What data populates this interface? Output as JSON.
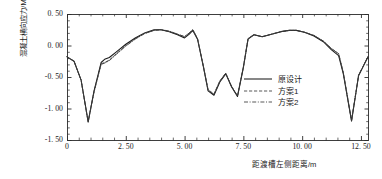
{
  "chart_data": {
    "type": "line",
    "title": "",
    "xlabel": "距渡槽左侧距离/m",
    "ylabel": "混凝土横向应力/MPa",
    "xlim": [
      0,
      12.8
    ],
    "ylim": [
      -1.5,
      0.5
    ],
    "xticks": [
      "0",
      "2. 50",
      "5. 00",
      "7. 50",
      "10. 00",
      "12. 50"
    ],
    "xtick_values": [
      0,
      2.5,
      5.0,
      7.5,
      10.0,
      12.5
    ],
    "yticks": [
      "0. 50",
      "0. 00",
      "-0. 50",
      "-1. 00",
      "-1. 50"
    ],
    "ytick_values": [
      0.5,
      0.0,
      -0.5,
      -1.0,
      -1.5
    ],
    "grid": false,
    "legend_position": "center-right",
    "series": [
      {
        "name": "原设计",
        "style": "solid",
        "color": "#1a1a1a",
        "x": [
          0.0,
          0.3,
          0.6,
          0.9,
          1.15,
          1.45,
          1.6,
          1.8,
          2.1,
          2.5,
          2.9,
          3.3,
          3.7,
          4.0,
          4.35,
          4.7,
          5.0,
          5.2,
          5.35,
          5.55,
          5.8,
          6.0,
          6.25,
          6.5,
          6.75,
          7.0,
          7.25,
          7.5,
          7.7,
          7.95,
          8.3,
          8.7,
          9.1,
          9.45,
          9.75,
          10.1,
          10.5,
          10.9,
          11.25,
          11.55,
          11.75,
          12.1,
          12.4,
          12.8
        ],
        "y": [
          -0.18,
          -0.25,
          -0.55,
          -1.21,
          -0.72,
          -0.27,
          -0.22,
          -0.19,
          -0.1,
          0.02,
          0.12,
          0.2,
          0.25,
          0.25,
          0.22,
          0.17,
          0.12,
          0.18,
          0.24,
          0.1,
          -0.34,
          -0.72,
          -0.79,
          -0.58,
          -0.45,
          -0.66,
          -0.81,
          -0.35,
          0.1,
          0.17,
          0.14,
          0.18,
          0.22,
          0.24,
          0.24,
          0.21,
          0.15,
          0.06,
          -0.07,
          -0.16,
          -0.45,
          -1.2,
          -0.48,
          -0.18
        ]
      },
      {
        "name": "方案1",
        "style": "dashed",
        "color": "#3a3a3a",
        "x": [
          0.0,
          0.3,
          0.6,
          0.9,
          1.15,
          1.45,
          1.6,
          1.8,
          2.1,
          2.5,
          2.9,
          3.3,
          3.7,
          4.0,
          4.35,
          4.7,
          5.0,
          5.2,
          5.35,
          5.55,
          5.8,
          6.0,
          6.25,
          6.5,
          6.75,
          7.0,
          7.25,
          7.5,
          7.7,
          7.95,
          8.3,
          8.7,
          9.1,
          9.45,
          9.75,
          10.1,
          10.5,
          10.9,
          11.25,
          11.55,
          11.75,
          12.1,
          12.4,
          12.8
        ],
        "y": [
          -0.18,
          -0.25,
          -0.55,
          -1.21,
          -0.73,
          -0.29,
          -0.27,
          -0.23,
          -0.13,
          0.0,
          0.11,
          0.19,
          0.24,
          0.25,
          0.22,
          0.18,
          0.14,
          0.2,
          0.25,
          0.11,
          -0.33,
          -0.7,
          -0.77,
          -0.56,
          -0.44,
          -0.65,
          -0.8,
          -0.34,
          0.11,
          0.17,
          0.14,
          0.18,
          0.22,
          0.24,
          0.24,
          0.21,
          0.16,
          0.07,
          -0.05,
          -0.13,
          -0.43,
          -1.19,
          -0.47,
          -0.18
        ]
      },
      {
        "name": "方案2",
        "style": "dashdot",
        "color": "#3a3a3a",
        "x": [
          0.0,
          0.3,
          0.6,
          0.9,
          1.15,
          1.45,
          1.6,
          1.8,
          2.1,
          2.5,
          2.9,
          3.3,
          3.7,
          4.0,
          4.35,
          4.7,
          5.0,
          5.2,
          5.35,
          5.55,
          5.8,
          6.0,
          6.25,
          6.5,
          6.75,
          7.0,
          7.25,
          7.5,
          7.7,
          7.95,
          8.3,
          8.7,
          9.1,
          9.45,
          9.75,
          10.1,
          10.5,
          10.9,
          11.25,
          11.55,
          11.75,
          12.1,
          12.4,
          12.8
        ],
        "y": [
          -0.18,
          -0.25,
          -0.55,
          -1.22,
          -0.74,
          -0.3,
          -0.28,
          -0.24,
          -0.14,
          -0.01,
          0.1,
          0.19,
          0.24,
          0.25,
          0.23,
          0.18,
          0.14,
          0.2,
          0.25,
          0.11,
          -0.33,
          -0.71,
          -0.78,
          -0.57,
          -0.44,
          -0.65,
          -0.8,
          -0.34,
          0.11,
          0.17,
          0.14,
          0.18,
          0.22,
          0.24,
          0.24,
          0.21,
          0.16,
          0.07,
          -0.05,
          -0.13,
          -0.43,
          -1.19,
          -0.47,
          -0.18
        ]
      }
    ]
  },
  "legend": {
    "items": [
      {
        "label": "原设计",
        "style": "solid"
      },
      {
        "label": "方案1",
        "style": "dashed"
      },
      {
        "label": "方案2",
        "style": "dashdot"
      }
    ]
  },
  "axes": {
    "frame_color": "#2b2b2b"
  }
}
